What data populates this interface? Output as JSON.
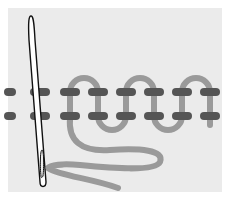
{
  "figure": {
    "colors": {
      "background": "#ffffff",
      "panel": "#ebebeb",
      "stitch": "#555555",
      "thread": "#9a9a9a",
      "needle_outline": "#111111",
      "needle_fill": "#ffffff"
    },
    "rows": {
      "top_y": 92,
      "bottom_y": 116
    },
    "stitch_x": [
      10,
      40,
      70,
      98,
      126,
      154,
      182,
      212
    ],
    "loops": [
      {
        "type": "top",
        "x1": 70,
        "x2": 98
      },
      {
        "type": "bottom",
        "x1": 98,
        "x2": 126
      },
      {
        "type": "top",
        "x1": 126,
        "x2": 154
      },
      {
        "type": "bottom",
        "x1": 154,
        "x2": 182
      },
      {
        "type": "top",
        "x1": 182,
        "x2": 210
      }
    ]
  }
}
